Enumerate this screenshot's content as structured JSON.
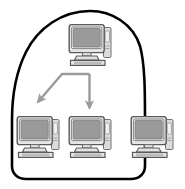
{
  "figure": {
    "title": "Multicast distribution from a server computer to a group of client computers",
    "background_color": "#ffffff"
  },
  "group_region": {
    "label": "group-boundary-blob",
    "stroke_color": "#000000",
    "fill_color": "#ffffff",
    "stroke_width": 2.6,
    "description": "Closed hand-drawn boundary enclosing the source computer and two destination computers"
  },
  "palette": {
    "outline": "#4d4d4d",
    "screen_fill": "#9a9a9a",
    "case_fill": "#d0d0d0",
    "body_fill": "#e8e8e8",
    "arrow": "#9a9a9a",
    "blob_stroke": "#000000"
  },
  "nodes": [
    {
      "id": "source-computer",
      "name": "computer-source-top",
      "role": "source",
      "inside_group": true,
      "x": 66,
      "y": 22,
      "width": 48,
      "height": 46
    },
    {
      "id": "target-computer-left",
      "name": "computer-target-left",
      "role": "target",
      "inside_group": true,
      "x": 14,
      "y": 114,
      "width": 48,
      "height": 46
    },
    {
      "id": "target-computer-middle",
      "name": "computer-target-middle",
      "role": "target",
      "inside_group": true,
      "x": 66,
      "y": 114,
      "width": 48,
      "height": 46
    },
    {
      "id": "outside-computer-right",
      "name": "computer-outside-right",
      "role": "non-member",
      "inside_group": false,
      "x": 128,
      "y": 114,
      "width": 48,
      "height": 46
    }
  ],
  "arrows": [
    {
      "id": "arrow-to-left",
      "name": "arrow-branch-left",
      "from": "source-computer",
      "to": "target-computer-left",
      "shape": "elbow-then-diagonal",
      "color": "#9a9a9a"
    },
    {
      "id": "arrow-to-middle",
      "name": "arrow-branch-down",
      "from": "source-computer",
      "to": "target-computer-middle",
      "shape": "straight-down",
      "color": "#9a9a9a"
    }
  ],
  "counts": {
    "computers_total": 4,
    "computers_in_group": 3,
    "computers_outside_group": 1,
    "arrows": 2
  }
}
